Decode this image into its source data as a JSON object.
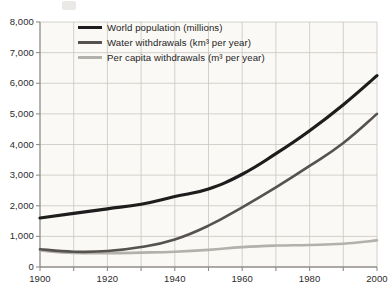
{
  "chart_data": {
    "type": "line",
    "title": "",
    "xlabel": "",
    "ylabel": "",
    "xlim": [
      1900,
      2000
    ],
    "ylim": [
      0,
      8000
    ],
    "grid": true,
    "legend_position": "top-left-inside",
    "x": [
      1900,
      1910,
      1920,
      1930,
      1940,
      1950,
      1960,
      1970,
      1980,
      1990,
      2000
    ],
    "xticks": [
      1900,
      1910,
      1920,
      1930,
      1940,
      1950,
      1960,
      1970,
      1980,
      1990,
      2000
    ],
    "xtick_labels": [
      "1900",
      "",
      "1920",
      "",
      "1940",
      "",
      "1960",
      "",
      "1980",
      "",
      "2000"
    ],
    "yticks": [
      0,
      1000,
      2000,
      3000,
      4000,
      5000,
      6000,
      7000,
      8000
    ],
    "ytick_labels": [
      "0",
      "1,000",
      "2,000",
      "3,000",
      "4,000",
      "5,000",
      "6,000",
      "7,000",
      "8,000"
    ],
    "series": [
      {
        "name": "World population (millions)",
        "color": "#1d1d1d",
        "width": 3.2,
        "values": [
          1600,
          1750,
          1900,
          2050,
          2300,
          2550,
          3030,
          3700,
          4450,
          5300,
          6250
        ]
      },
      {
        "name": "Water withdrawals (km³ per year)",
        "color": "#555250",
        "width": 2.6,
        "values": [
          580,
          500,
          520,
          650,
          900,
          1350,
          1950,
          2600,
          3300,
          4050,
          5000
        ]
      },
      {
        "name": "Per capita withdrawals (m³ per year)",
        "color": "#b3b1ac",
        "width": 2.6,
        "values": [
          540,
          460,
          450,
          470,
          500,
          560,
          650,
          700,
          720,
          760,
          870
        ]
      }
    ]
  },
  "legend": {
    "items": [
      {
        "label": "World population (millions)"
      },
      {
        "label": "Water withdrawals (km³ per year)"
      },
      {
        "label": "Per capita withdrawals (m³ per year)"
      }
    ]
  },
  "axes": {
    "y_labels": [
      "8,000",
      "7,000",
      "6,000",
      "5,000",
      "4,000",
      "3,000",
      "2,000",
      "1,000",
      "0"
    ],
    "x_labels": [
      "1900",
      "1920",
      "1940",
      "1960",
      "1980",
      "2000"
    ]
  },
  "colors": {
    "background": "#ffffff",
    "plot_background": "#faf9f5",
    "grid": "#c9c7c2",
    "axis": "#8f8d88",
    "text": "#2b2b2b",
    "series_population": "#1d1d1d",
    "series_water": "#555250",
    "series_percapita": "#b3b1ac"
  }
}
